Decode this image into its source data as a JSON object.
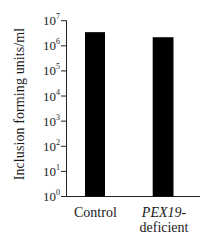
{
  "chart_data": {
    "type": "bar",
    "title": "",
    "xlabel": "",
    "ylabel": "Inclusion forming units/ml",
    "yscale": "log",
    "ylim": [
      1,
      10000000
    ],
    "yticks": [
      {
        "value": 1,
        "exp": "0"
      },
      {
        "value": 10,
        "exp": "1"
      },
      {
        "value": 100,
        "exp": "2"
      },
      {
        "value": 1000,
        "exp": "3"
      },
      {
        "value": 10000,
        "exp": "4"
      },
      {
        "value": 100000,
        "exp": "5"
      },
      {
        "value": 1000000,
        "exp": "6"
      },
      {
        "value": 10000000,
        "exp": "7"
      }
    ],
    "categories": [
      "Control",
      "PEX19-deficient"
    ],
    "category_labels": [
      {
        "line1": "Control",
        "line2": "",
        "italic_part": ""
      },
      {
        "line1": "PEX19-",
        "line2": "deficient",
        "italic_part": "PEX19"
      }
    ],
    "values": [
      3500000,
      2200000
    ],
    "bar_color": "#000000",
    "grid": false,
    "legend": null
  }
}
